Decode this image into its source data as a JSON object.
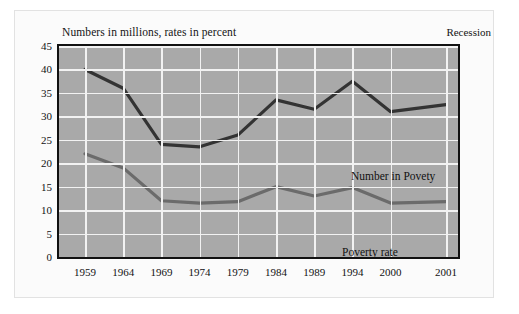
{
  "figure": {
    "title": "Numbers in millions, rates in percent",
    "corner_note": "Recession"
  },
  "chart_data": {
    "type": "line",
    "title": "Numbers in millions, rates in percent",
    "xlabel": "",
    "ylabel": "",
    "ylim": [
      0,
      45
    ],
    "yticks": [
      0,
      5,
      10,
      15,
      20,
      25,
      30,
      35,
      40,
      45
    ],
    "categories": [
      "1959",
      "1964",
      "1969",
      "1974",
      "1979",
      "1984",
      "1989",
      "1994",
      "2000",
      "2001"
    ],
    "grid": true,
    "legend": "inline-annotations",
    "annotations": [
      "Recession"
    ],
    "series": [
      {
        "name": "Number in Povety",
        "color": "#333333",
        "values": [
          40.0,
          36.0,
          24.0,
          23.5,
          26.0,
          33.5,
          31.5,
          37.5,
          31.0,
          32.5
        ]
      },
      {
        "name": "Poverty rate",
        "color": "#6b6b6b",
        "values": [
          22.0,
          19.0,
          12.0,
          11.5,
          11.8,
          15.0,
          13.0,
          14.8,
          11.5,
          11.8
        ]
      }
    ]
  }
}
